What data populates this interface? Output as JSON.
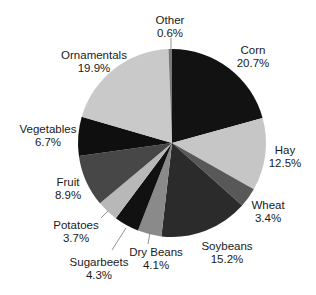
{
  "chart_data": {
    "type": "pie",
    "title": "",
    "start_angle_deg": 0,
    "direction": "clockwise",
    "unit": "%",
    "slices": [
      {
        "label": "Corn",
        "value": 20.7,
        "display": "20.7%",
        "color": "#121212",
        "label_x": 253,
        "label_y": 44
      },
      {
        "label": "Hay",
        "value": 12.5,
        "display": "12.5%",
        "color": "#c6c6c6",
        "label_x": 285,
        "label_y": 144
      },
      {
        "label": "Wheat",
        "value": 3.4,
        "display": "3.4%",
        "color": "#585858",
        "label_x": 268,
        "label_y": 199
      },
      {
        "label": "Soybeans",
        "value": 15.2,
        "display": "15.2%",
        "color": "#2b2b2b",
        "label_x": 227,
        "label_y": 240
      },
      {
        "label": "Dry Beans",
        "value": 4.1,
        "display": "4.1%",
        "color": "#8a8a8a",
        "label_x": 156,
        "label_y": 246
      },
      {
        "label": "Sugarbeets",
        "value": 4.3,
        "display": "4.3%",
        "color": "#111111",
        "label_x": 99,
        "label_y": 256
      },
      {
        "label": "Potatoes",
        "value": 3.7,
        "display": "3.7%",
        "color": "#b8b8b8",
        "label_x": 76,
        "label_y": 219
      },
      {
        "label": "Fruit",
        "value": 8.9,
        "display": "8.9%",
        "color": "#474747",
        "label_x": 68,
        "label_y": 176
      },
      {
        "label": "Vegetables",
        "value": 6.7,
        "display": "6.7%",
        "color": "#0f0f0f",
        "label_x": 48,
        "label_y": 123
      },
      {
        "label": "Ornamentals",
        "value": 19.9,
        "display": "19.9%",
        "color": "#c9c9c9",
        "label_x": 94,
        "label_y": 49
      },
      {
        "label": "Other",
        "value": 0.6,
        "display": "0.6%",
        "color": "#7a7a7a",
        "label_x": 170,
        "label_y": 14
      }
    ],
    "leader_lines": [
      {
        "label": "Other",
        "x1": 171,
        "y1": 38,
        "x2": 171,
        "y2": 52
      },
      {
        "label": "Potatoes",
        "x1": 101,
        "y1": 218,
        "x2": 108,
        "y2": 211
      },
      {
        "label": "Sugarbeets",
        "x1": 112,
        "y1": 250,
        "x2": 126,
        "y2": 228
      },
      {
        "label": "Dry Beans",
        "x1": 148,
        "y1": 244,
        "x2": 150,
        "y2": 233
      }
    ],
    "center": [
      172,
      143
    ],
    "radius": 94
  }
}
